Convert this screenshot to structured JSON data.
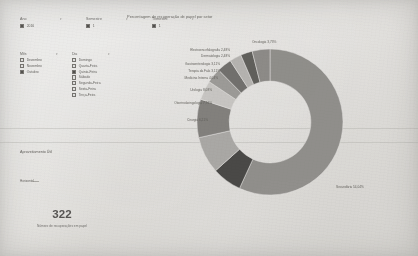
{
  "filters_top": [
    {
      "name": "Ano",
      "value": "2016",
      "checked": true
    },
    {
      "name": "Semestre",
      "value": "1",
      "checked": true
    },
    {
      "name": "Trimestre",
      "value": "1",
      "checked": true
    }
  ],
  "filter_panels": [
    {
      "title": "Mês",
      "options": [
        {
          "label": "Dezembro",
          "checked": false
        },
        {
          "label": "Novembro",
          "checked": false
        },
        {
          "label": "Outubro",
          "checked": true
        }
      ]
    },
    {
      "title": "Dia",
      "options": [
        {
          "label": "Domingo",
          "checked": false
        },
        {
          "label": "Quarta-Feira",
          "checked": false
        },
        {
          "label": "Quinta-Feira",
          "checked": true
        },
        {
          "label": "Sábado",
          "checked": false
        },
        {
          "label": "Segunda-Feira",
          "checked": false
        },
        {
          "label": "Sexta-Feira",
          "checked": false
        },
        {
          "label": "Terça-Feira",
          "checked": false
        }
      ]
    }
  ],
  "main_chart": {
    "title": "Percentagem de recuperação de papel por setor"
  },
  "kpi": {
    "title": "Aproveitamento Útil",
    "slice_label": "Horizontal",
    "value": "322",
    "subtitle": "Número de recuperações em papel"
  },
  "chart_data": {
    "type": "pie",
    "title": "Percentagem de recuperação de papel por setor",
    "subtype": "donut",
    "legend": "none",
    "value_unit": "%",
    "labels": [
      "Secundária",
      "Cirurgia",
      "Otorrinolaringologia",
      "Urologia",
      "Medicina Interna",
      "Terapia da Fala",
      "Gastroenterologia",
      "Dermatologia",
      "Electroencefalografia",
      "Oncologia"
    ],
    "values": [
      54.04,
      6.21,
      7.76,
      8.08,
      4.04,
      3.11,
      3.11,
      2.48,
      2.48,
      3.73
    ],
    "data_labels": [
      "Secundária 54,04%",
      "Cirurgia 6,21%",
      "Otorrinolaringologia 7,76%",
      "Urologia 8,08%",
      "Medicina Interna 4,04%",
      "Terapia da Fala 3,11%",
      "Gastroenterologia 3,11%",
      "Dermatologia 2,48%",
      "Electroencefalografia 2,48%",
      "Oncologia 3,73%"
    ],
    "colors": [
      "#8e8c88",
      "#3b3a37",
      "#acaaa6",
      "#7d7b77",
      "#cfcdc9",
      "#9c9a96",
      "#6a6865",
      "#b9b7b3",
      "#565450",
      "#8a8884"
    ],
    "hole_ratio": 0.56
  },
  "kpi_chart_data": {
    "type": "pie",
    "subtype": "donut",
    "title": "Aproveitamento Útil",
    "labels": [
      "Horizontal"
    ],
    "values": [
      100
    ],
    "colors": [
      "#86847f"
    ],
    "hole_ratio": 0.55
  },
  "colors": {
    "page_bg": "#f1efec",
    "text": "#57554f",
    "checkbox_on": "#44423e",
    "accent_dark": "#3b3a37",
    "accent_mid": "#8e8c88"
  }
}
